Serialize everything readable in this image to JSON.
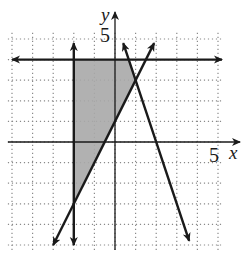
{
  "chart_data": {
    "type": "line",
    "title": "",
    "xlabel": "x",
    "ylabel": "y",
    "xlim": [
      -5,
      5
    ],
    "ylim": [
      -5,
      5
    ],
    "grid": true,
    "grid_style": "dotted",
    "tick_labels": {
      "x": [
        "5"
      ],
      "y": [
        "5"
      ]
    },
    "series": [
      {
        "name": "y = 4",
        "kind": "horizontal",
        "equation": "y = 4",
        "points": [
          [
            -5,
            4
          ],
          [
            5,
            4
          ]
        ]
      },
      {
        "name": "x = -2",
        "kind": "vertical",
        "equation": "x = -2",
        "points": [
          [
            -2,
            4.8
          ],
          [
            -2,
            -5
          ]
        ]
      },
      {
        "name": "y = 2x + 1",
        "kind": "line",
        "equation": "y = 2x + 1",
        "points": [
          [
            -3,
            -5
          ],
          [
            1.9,
            4.8
          ]
        ]
      },
      {
        "name": "y = -3x + 6",
        "kind": "line",
        "equation": "y = -3x + 6",
        "points": [
          [
            0.4,
            4.8
          ],
          [
            3.6,
            -4.8
          ]
        ]
      }
    ],
    "shaded_region": {
      "description": "feasible region: x >= -2, y <= 4, y >= 2x + 1, y <= -3x + 6",
      "vertices": [
        [
          -2,
          4
        ],
        [
          0.67,
          4
        ],
        [
          1,
          3
        ],
        [
          -2,
          -3
        ]
      ],
      "fill": "#a9a9a9"
    }
  },
  "labels": {
    "x_axis": "x",
    "y_axis": "y",
    "x_tick": "5",
    "y_tick": "5"
  },
  "colors": {
    "line": "#1a1a1a",
    "grid": "#8a8a8a",
    "shade": "#a9a9a9"
  }
}
